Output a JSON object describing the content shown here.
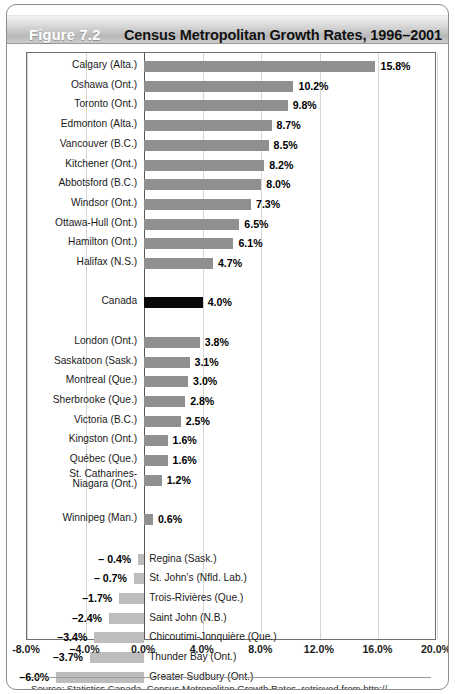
{
  "figure": {
    "label": "Figure 7.2",
    "title": "Census Metropolitan Growth Rates, 1996–2001"
  },
  "source": {
    "text": "Source: Statistics Canada, Census Metropolitan Growth Rates, retrieved from http://"
  },
  "colors": {
    "positive_bar": "#8f8f8f",
    "canada_bar": "#0a0a0a",
    "negative_bar": "#bdbdbd",
    "axis": "#555555",
    "grid": "#d6d6d6",
    "frame": "#6f6f6f",
    "title_text": "#111111",
    "figure_label_text": "#ffffff"
  },
  "chart_data": {
    "type": "bar",
    "orientation": "horizontal",
    "title": "Census Metropolitan Growth Rates, 1996–2001",
    "xlabel": "",
    "ylabel": "",
    "xlim": [
      -8.0,
      20.0
    ],
    "xticks": [
      -8.0,
      -4.0,
      0.0,
      4.0,
      8.0,
      12.0,
      16.0,
      20.0
    ],
    "xtick_labels": [
      "-8.0%",
      "–4.0%",
      "0.0%",
      "4.0%",
      "8.0%",
      "12.0%",
      "16.0%",
      "20.0%"
    ],
    "grid": true,
    "legend": false,
    "value_suffix": "%",
    "categories": [
      "Calgary (Alta.)",
      "Oshawa (Ont.)",
      "Toronto (Ont.)",
      "Edmonton (Alta.)",
      "Vancouver (B.C.)",
      "Kitchener (Ont.)",
      "Abbotsford (B.C.)",
      "Windsor (Ont.)",
      "Ottawa-Hull (Ont.)",
      "Hamilton (Ont.)",
      "Halifax (N.S.)",
      "Canada",
      "London (Ont.)",
      "Saskatoon (Sask.)",
      "Montreal (Que.)",
      "Sherbrooke (Que.)",
      "Victoria (B.C.)",
      "Kingston (Ont.)",
      "Québec (Que.)",
      "St. Catharines-Niagara (Ont.)",
      "Winnipeg (Man.)",
      "Regina (Sask.)",
      "St. John's (Nfld. Lab.)",
      "Trois-Rivières (Que.)",
      "Saint John (N.B.)",
      "Chicoutimi-Jonquière (Que.)",
      "Thunder Bay (Ont.)",
      "Greater Sudbury (Ont.)"
    ],
    "values": [
      15.8,
      10.2,
      9.8,
      8.7,
      8.5,
      8.2,
      8.0,
      7.3,
      6.5,
      6.1,
      4.7,
      4.0,
      3.8,
      3.1,
      3.0,
      2.8,
      2.5,
      1.6,
      1.6,
      1.2,
      0.6,
      -0.4,
      -0.7,
      -1.7,
      -2.4,
      -3.4,
      -3.7,
      -6.0
    ]
  },
  "rows": [
    {
      "name": "Calgary (Alta.)",
      "value": 15.8,
      "value_label": "15.8%",
      "kind": "positive",
      "slot": 0
    },
    {
      "name": "Oshawa (Ont.)",
      "value": 10.2,
      "value_label": "10.2%",
      "kind": "positive",
      "slot": 1
    },
    {
      "name": "Toronto (Ont.)",
      "value": 9.8,
      "value_label": "9.8%",
      "kind": "positive",
      "slot": 2
    },
    {
      "name": "Edmonton (Alta.)",
      "value": 8.7,
      "value_label": "8.7%",
      "kind": "positive",
      "slot": 3
    },
    {
      "name": "Vancouver (B.C.)",
      "value": 8.5,
      "value_label": "8.5%",
      "kind": "positive",
      "slot": 4
    },
    {
      "name": "Kitchener (Ont.)",
      "value": 8.2,
      "value_label": "8.2%",
      "kind": "positive",
      "slot": 5
    },
    {
      "name": "Abbotsford (B.C.)",
      "value": 8.0,
      "value_label": "8.0%",
      "kind": "positive",
      "slot": 6
    },
    {
      "name": "Windsor (Ont.)",
      "value": 7.3,
      "value_label": "7.3%",
      "kind": "positive",
      "slot": 7
    },
    {
      "name": "Ottawa-Hull (Ont.)",
      "value": 6.5,
      "value_label": "6.5%",
      "kind": "positive",
      "slot": 8
    },
    {
      "name": "Hamilton (Ont.)",
      "value": 6.1,
      "value_label": "6.1%",
      "kind": "positive",
      "slot": 9
    },
    {
      "name": "Halifax (N.S.)",
      "value": 4.7,
      "value_label": "4.7%",
      "kind": "positive",
      "slot": 10
    },
    {
      "name": "Canada",
      "value": 4.0,
      "value_label": "4.0%",
      "kind": "canada",
      "slot": 12
    },
    {
      "name": "London (Ont.)",
      "value": 3.8,
      "value_label": "3.8%",
      "kind": "positive",
      "slot": 14
    },
    {
      "name": "Saskatoon (Sask.)",
      "value": 3.1,
      "value_label": "3.1%",
      "kind": "positive",
      "slot": 15
    },
    {
      "name": "Montreal (Que.)",
      "value": 3.0,
      "value_label": "3.0%",
      "kind": "positive",
      "slot": 16
    },
    {
      "name": "Sherbrooke (Que.)",
      "value": 2.8,
      "value_label": "2.8%",
      "kind": "positive",
      "slot": 17
    },
    {
      "name": "Victoria (B.C.)",
      "value": 2.5,
      "value_label": "2.5%",
      "kind": "positive",
      "slot": 18
    },
    {
      "name": "Kingston (Ont.)",
      "value": 1.6,
      "value_label": "1.6%",
      "kind": "positive",
      "slot": 19
    },
    {
      "name": "Québec (Que.)",
      "value": 1.6,
      "value_label": "1.6%",
      "kind": "positive",
      "slot": 20
    },
    {
      "name": "St. Catharines-\nNiagara (Ont.)",
      "value": 1.2,
      "value_label": "1.2%",
      "kind": "positive",
      "slot": 21,
      "two_line": true
    },
    {
      "name": "Winnipeg (Man.)",
      "value": 0.6,
      "value_label": "0.6%",
      "kind": "positive",
      "slot": 23
    },
    {
      "name": "Regina (Sask.)",
      "value": -0.4,
      "value_label": "– 0.4%",
      "kind": "negative",
      "slot": 25
    },
    {
      "name": "St. John's (Nfld. Lab.)",
      "value": -0.7,
      "value_label": "– 0.7%",
      "kind": "negative",
      "slot": 26
    },
    {
      "name": "Trois-Rivières (Que.)",
      "value": -1.7,
      "value_label": "–1.7%",
      "kind": "negative",
      "slot": 27
    },
    {
      "name": "Saint John (N.B.)",
      "value": -2.4,
      "value_label": "–2.4%",
      "kind": "negative",
      "slot": 28
    },
    {
      "name": "Chicoutimi-Jonquière (Que.)",
      "value": -3.4,
      "value_label": "–3.4%",
      "kind": "negative",
      "slot": 29
    },
    {
      "name": "Thunder Bay (Ont.)",
      "value": -3.7,
      "value_label": "–3.7%",
      "kind": "negative",
      "slot": 30
    },
    {
      "name": "Greater Sudbury (Ont.)",
      "value": -6.0,
      "value_label": "–6.0%",
      "kind": "negative",
      "slot": 31
    }
  ]
}
